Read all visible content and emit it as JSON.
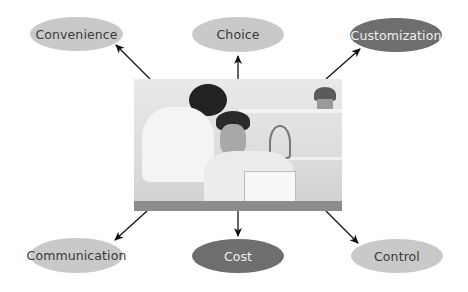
{
  "diagram": {
    "center": {
      "label": "photo-couple-at-laptop",
      "description": "Woman and man looking at a laptop"
    },
    "nodes": [
      {
        "id": "convenience",
        "label": "Convenience",
        "shade": "light"
      },
      {
        "id": "choice",
        "label": "Choice",
        "shade": "light"
      },
      {
        "id": "customization",
        "label": "Customization",
        "shade": "dark"
      },
      {
        "id": "communication",
        "label": "Communication",
        "shade": "light"
      },
      {
        "id": "cost",
        "label": "Cost",
        "shade": "dark"
      },
      {
        "id": "control",
        "label": "Control",
        "shade": "light"
      }
    ],
    "colors": {
      "light_fill": "#c9c9c9",
      "dark_fill": "#6e6e6e",
      "arrow": "#111111"
    }
  }
}
